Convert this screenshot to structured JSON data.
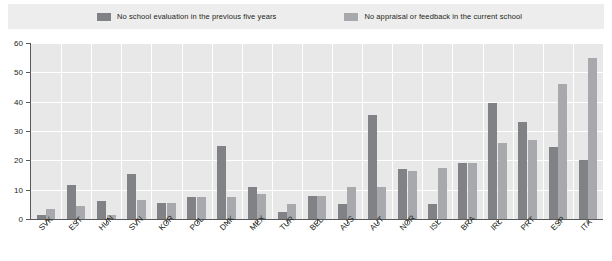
{
  "legend": {
    "items": [
      {
        "label": "No school evaluation in the previous five years",
        "color": "#808285",
        "name": "legend-series-0"
      },
      {
        "label": "No appraisal or feedback in the current school",
        "color": "#a7a9ac",
        "name": "legend-series-1"
      }
    ]
  },
  "chart_data": {
    "type": "bar",
    "title": "",
    "xlabel": "",
    "ylabel": "",
    "ylim": [
      0,
      60
    ],
    "yticks": [
      0,
      10,
      20,
      30,
      40,
      50,
      60
    ],
    "grid": true,
    "legend_position": "top",
    "categories": [
      "SVK",
      "EST",
      "HUN",
      "SVN",
      "KOR",
      "POL",
      "DNK",
      "MEX",
      "TUR",
      "BEL",
      "AUS",
      "AUT",
      "NOR",
      "ISL",
      "BRA",
      "IRL",
      "PRT",
      "ESP",
      "ITA"
    ],
    "series": [
      {
        "name": "No school evaluation in the previous five years",
        "color": "#808285",
        "values": [
          1.5,
          11.5,
          6,
          15.5,
          5.5,
          7.5,
          25,
          11,
          2.5,
          8,
          5,
          35.5,
          17,
          5,
          19,
          39.5,
          33,
          24.5,
          20
        ]
      },
      {
        "name": "No appraisal or feedback in the current school",
        "color": "#a7a9ac",
        "values": [
          3.5,
          4.5,
          1.5,
          6.5,
          5.5,
          7.5,
          7.5,
          8.5,
          5,
          8,
          11,
          11,
          16.5,
          17.5,
          19,
          26,
          27,
          46,
          55
        ]
      }
    ]
  }
}
